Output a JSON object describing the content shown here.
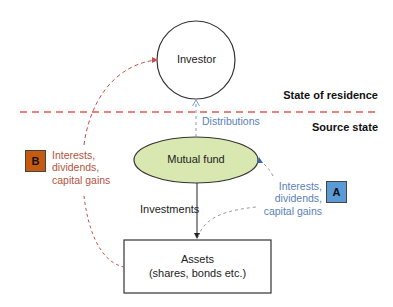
{
  "diagram": {
    "nodes": {
      "investor": {
        "label": "Investor"
      },
      "mutual_fund": {
        "label": "Mutual fund",
        "fill": "#D8E8B0"
      },
      "assets": {
        "line1": "Assets",
        "line2": "(shares, bonds etc.)"
      }
    },
    "regions": {
      "upper": "State of residence",
      "lower": "Source state",
      "divider_color": "#E05A4F"
    },
    "edges": {
      "distributions": "Distributions",
      "investments": "Investments"
    },
    "flows": {
      "a": {
        "badge": "A",
        "badge_color": "#5B9BD5",
        "lines": [
          "Interests,",
          "dividends,",
          "capital gains"
        ],
        "text_color": "#5A7FB8"
      },
      "b": {
        "badge": "B",
        "badge_color": "#C55A11",
        "lines": [
          "Interests,",
          "dividends,",
          "capital gains"
        ],
        "text_color": "#B5533C"
      }
    }
  }
}
